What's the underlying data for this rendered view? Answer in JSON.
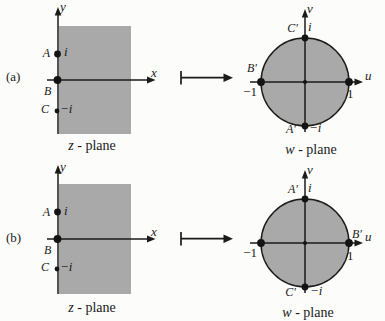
{
  "colors": {
    "region_fill": "#a9a9a9",
    "ink": "#1b1b1b",
    "background": "#fcfcfa"
  },
  "icons": {
    "maps_to_arrow": "↦"
  },
  "rows": [
    {
      "label": "(a)",
      "z": {
        "y_axis": "y",
        "x_axis": "x",
        "point_a": "A",
        "point_a_value": "i",
        "point_b": "B",
        "point_c": "C",
        "point_c_value": "−i",
        "caption_var": "z",
        "caption_rest": "- plane"
      },
      "w": {
        "v_axis": "v",
        "u_axis": "u",
        "top_name": "C′",
        "top_value": "i",
        "left_name": "B′",
        "left_value": "−1",
        "right_name": "",
        "right_value": "1",
        "bottom_name": "A′",
        "bottom_value": "−i",
        "caption_var": "w",
        "caption_rest": "- plane"
      }
    },
    {
      "label": "(b)",
      "z": {
        "y_axis": "y",
        "x_axis": "x",
        "point_a": "A",
        "point_a_value": "i",
        "point_b": "B",
        "point_c": "C",
        "point_c_value": "−i",
        "caption_var": "z",
        "caption_rest": "- plane"
      },
      "w": {
        "v_axis": "v",
        "u_axis": "u",
        "top_name": "A′",
        "top_value": "i",
        "left_name": "",
        "left_value": "−1",
        "right_name": "B′",
        "right_value": "1",
        "bottom_name": "C′",
        "bottom_value": "−i",
        "caption_var": "w",
        "caption_rest": "- plane"
      }
    }
  ]
}
